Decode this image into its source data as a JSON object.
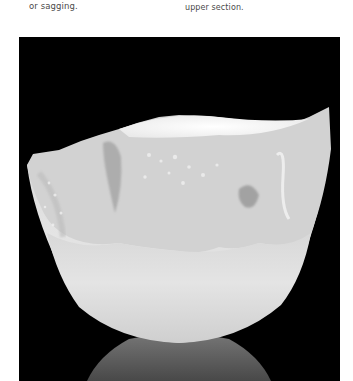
{
  "page": {
    "captions": {
      "left": "or sagging.",
      "right": "upper section."
    },
    "figure": {
      "subject": "translucent porcelain bowl with torn, textured rim on black background with reflection",
      "background_color": "#000000",
      "bowl_color": "#e6e6e6"
    }
  }
}
